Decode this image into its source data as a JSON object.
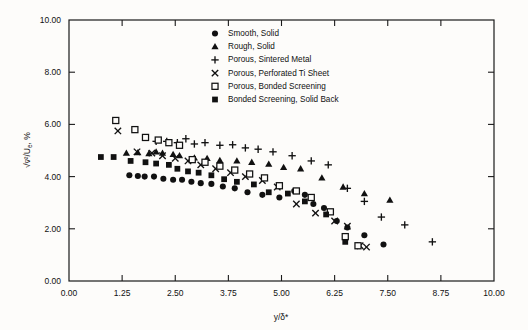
{
  "chart_data": {
    "type": "scatter",
    "title": "",
    "xlabel": "y/δ*",
    "ylabel": "√(v¯²)/Uₑ, %",
    "xlim": [
      0,
      10
    ],
    "ylim": [
      0,
      10
    ],
    "xticks": [
      "0.00",
      "1.25",
      "2.50",
      "3.75",
      "5.00",
      "6.25",
      "7.50",
      "8.75",
      "10.00"
    ],
    "xtick_values": [
      0,
      1.25,
      2.5,
      3.75,
      5,
      6.25,
      7.5,
      8.75,
      10
    ],
    "yticks": [
      "0.00",
      "2.00",
      "4.00",
      "6.00",
      "8.00",
      "10.00"
    ],
    "ytick_values": [
      0,
      2,
      4,
      6,
      8,
      10
    ],
    "grid": false,
    "legend_position": "top-right",
    "series": [
      {
        "name": "Smooth, Solid",
        "marker": "filled-circle",
        "color": "#111111",
        "points": [
          [
            1.42,
            4.05
          ],
          [
            1.62,
            4.02
          ],
          [
            1.78,
            4.0
          ],
          [
            2.0,
            4.0
          ],
          [
            2.22,
            3.92
          ],
          [
            2.45,
            3.88
          ],
          [
            2.66,
            3.88
          ],
          [
            2.88,
            3.8
          ],
          [
            3.1,
            3.75
          ],
          [
            3.35,
            3.72
          ],
          [
            3.62,
            3.62
          ],
          [
            3.9,
            3.55
          ],
          [
            4.2,
            3.4
          ],
          [
            4.55,
            3.3
          ],
          [
            4.95,
            3.2
          ],
          [
            5.3,
            3.45
          ],
          [
            5.55,
            3.3
          ],
          [
            5.75,
            2.95
          ],
          [
            6.0,
            2.8
          ],
          [
            6.3,
            2.3
          ],
          [
            6.55,
            2.05
          ],
          [
            6.95,
            1.75
          ],
          [
            7.4,
            1.4
          ]
        ]
      },
      {
        "name": "Rough, Solid",
        "marker": "filled-triangle",
        "color": "#111111",
        "points": [
          [
            1.35,
            4.9
          ],
          [
            1.62,
            4.92
          ],
          [
            1.88,
            4.88
          ],
          [
            2.05,
            4.95
          ],
          [
            2.2,
            4.9
          ],
          [
            2.45,
            4.85
          ],
          [
            2.6,
            4.8
          ],
          [
            2.95,
            4.72
          ],
          [
            3.25,
            4.7
          ],
          [
            3.55,
            4.62
          ],
          [
            3.95,
            4.6
          ],
          [
            4.3,
            4.55
          ],
          [
            4.7,
            4.48
          ],
          [
            5.05,
            4.35
          ],
          [
            5.45,
            4.3
          ],
          [
            5.95,
            3.95
          ],
          [
            6.45,
            3.6
          ],
          [
            6.95,
            3.35
          ],
          [
            7.55,
            3.1
          ]
        ]
      },
      {
        "name": "Porous, Sintered Metal",
        "marker": "plus",
        "color": "#111111",
        "points": [
          [
            2.05,
            5.35
          ],
          [
            2.3,
            5.35
          ],
          [
            2.55,
            5.3
          ],
          [
            2.75,
            5.45
          ],
          [
            2.95,
            5.25
          ],
          [
            3.2,
            5.3
          ],
          [
            3.55,
            5.2
          ],
          [
            3.85,
            5.22
          ],
          [
            4.15,
            5.1
          ],
          [
            4.45,
            5.05
          ],
          [
            4.8,
            4.95
          ],
          [
            5.25,
            4.8
          ],
          [
            5.7,
            4.6
          ],
          [
            6.1,
            4.45
          ],
          [
            6.55,
            3.55
          ],
          [
            6.95,
            3.05
          ],
          [
            7.35,
            2.45
          ],
          [
            7.9,
            2.15
          ],
          [
            8.55,
            1.5
          ]
        ]
      },
      {
        "name": "Porous, Perforated Ti Sheet",
        "marker": "cross",
        "color": "#111111",
        "points": [
          [
            1.15,
            5.75
          ],
          [
            1.6,
            4.95
          ],
          [
            1.95,
            4.9
          ],
          [
            2.2,
            4.8
          ],
          [
            2.5,
            4.7
          ],
          [
            2.8,
            4.6
          ],
          [
            3.1,
            4.45
          ],
          [
            3.45,
            4.3
          ],
          [
            3.8,
            4.15
          ],
          [
            4.15,
            4.0
          ],
          [
            4.55,
            3.85
          ],
          [
            4.9,
            3.6
          ],
          [
            5.35,
            2.95
          ],
          [
            5.8,
            2.6
          ],
          [
            6.25,
            2.3
          ],
          [
            6.55,
            2.1
          ],
          [
            6.85,
            1.35
          ],
          [
            7.0,
            1.3
          ]
        ]
      },
      {
        "name": "Porous, Bonded Screening",
        "marker": "open-square",
        "color": "#111111",
        "points": [
          [
            1.1,
            6.15
          ],
          [
            1.55,
            5.8
          ],
          [
            1.8,
            5.5
          ],
          [
            2.1,
            5.4
          ],
          [
            2.35,
            5.3
          ],
          [
            2.6,
            5.2
          ],
          [
            2.9,
            4.65
          ],
          [
            3.2,
            4.55
          ],
          [
            3.55,
            4.4
          ],
          [
            3.9,
            4.25
          ],
          [
            4.25,
            4.1
          ],
          [
            4.6,
            3.95
          ],
          [
            4.95,
            3.65
          ],
          [
            5.35,
            3.45
          ],
          [
            5.7,
            3.2
          ],
          [
            6.15,
            2.65
          ],
          [
            6.5,
            1.7
          ],
          [
            6.8,
            1.35
          ]
        ]
      },
      {
        "name": "Bonded Screening, Solid Back",
        "marker": "filled-square",
        "color": "#111111",
        "points": [
          [
            0.75,
            4.75
          ],
          [
            1.05,
            4.75
          ],
          [
            1.45,
            4.6
          ],
          [
            1.8,
            4.55
          ],
          [
            2.05,
            4.5
          ],
          [
            2.35,
            4.45
          ],
          [
            2.55,
            4.3
          ],
          [
            2.8,
            4.2
          ],
          [
            3.05,
            4.15
          ],
          [
            3.35,
            4.05
          ],
          [
            3.65,
            3.9
          ],
          [
            3.95,
            3.8
          ],
          [
            4.35,
            3.7
          ],
          [
            4.7,
            3.4
          ],
          [
            5.15,
            3.35
          ],
          [
            5.55,
            3.05
          ],
          [
            6.05,
            2.55
          ],
          [
            6.5,
            1.5
          ]
        ]
      }
    ]
  },
  "legend": {
    "items": [
      {
        "label": "Smooth, Solid",
        "marker": "filled-circle"
      },
      {
        "label": "Rough, Solid",
        "marker": "filled-triangle"
      },
      {
        "label": "Porous, Sintered Metal",
        "marker": "plus"
      },
      {
        "label": "Porous, Perforated Ti Sheet",
        "marker": "cross"
      },
      {
        "label": "Porous, Bonded Screening",
        "marker": "open-square"
      },
      {
        "label": "Bonded Screening, Solid Back",
        "marker": "filled-square"
      }
    ]
  },
  "colors": {
    "ink": "#111111",
    "paper": "#fdfcfa"
  }
}
